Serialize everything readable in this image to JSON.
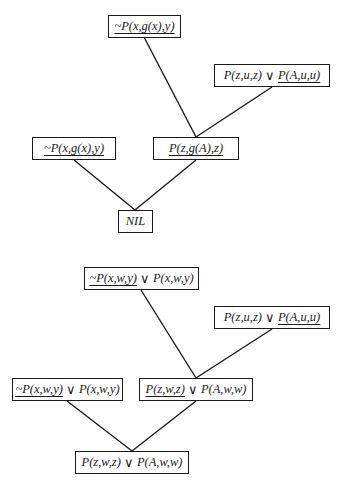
{
  "diagrams": [
    {
      "name": "refutation-tree",
      "nodes": [
        {
          "id": "n1",
          "literals": [
            {
              "text": "~P(x,g(x),y)",
              "underlined": true
            }
          ]
        },
        {
          "id": "n2",
          "literals": [
            {
              "text": "P(z,u,z)",
              "underlined": false
            },
            {
              "text": "P(A,u,u)",
              "underlined": true
            }
          ]
        },
        {
          "id": "n3",
          "literals": [
            {
              "text": "~P(x,g(x),y)",
              "underlined": true
            }
          ]
        },
        {
          "id": "n4",
          "literals": [
            {
              "text": "P(z,g(A),z)",
              "underlined": true
            }
          ]
        },
        {
          "id": "n5",
          "literals": [
            {
              "text": "NIL",
              "underlined": false
            }
          ]
        }
      ],
      "edges": [
        [
          "n1",
          "n4"
        ],
        [
          "n2",
          "n4"
        ],
        [
          "n3",
          "n5"
        ],
        [
          "n4",
          "n5"
        ]
      ]
    },
    {
      "name": "tautology-tree",
      "nodes": [
        {
          "id": "m1",
          "literals": [
            {
              "text": "~P(x,w,y)",
              "underlined": true
            },
            {
              "text": "P(x,w,y)",
              "underlined": false
            }
          ]
        },
        {
          "id": "m2",
          "literals": [
            {
              "text": "P(z,u,z)",
              "underlined": false
            },
            {
              "text": "P(A,u,u)",
              "underlined": true
            }
          ]
        },
        {
          "id": "m3",
          "literals": [
            {
              "text": "~P(x,w,y)",
              "underlined": true
            },
            {
              "text": "P(x,w,y)",
              "underlined": false
            }
          ]
        },
        {
          "id": "m4",
          "literals": [
            {
              "text": "P(z,w,z)",
              "underlined": true
            },
            {
              "text": "P(A,w,w)",
              "underlined": false
            }
          ]
        },
        {
          "id": "m5",
          "literals": [
            {
              "text": "P(z,w,z)",
              "underlined": false
            },
            {
              "text": "P(A,w,w)",
              "underlined": false
            }
          ]
        }
      ],
      "edges": [
        [
          "m1",
          "m4"
        ],
        [
          "m2",
          "m4"
        ],
        [
          "m3",
          "m5"
        ],
        [
          "m4",
          "m5"
        ]
      ]
    }
  ],
  "symbols": {
    "or": "∨"
  }
}
